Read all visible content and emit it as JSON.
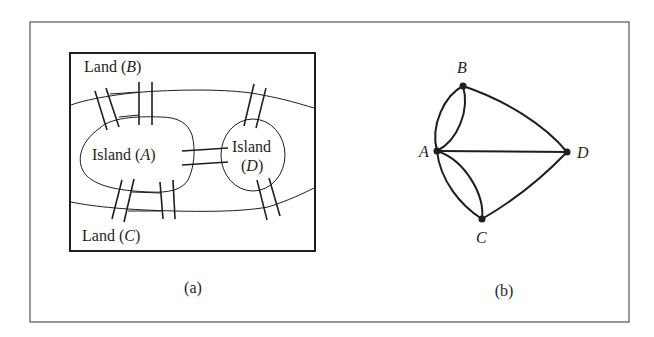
{
  "figure": {
    "panel_a": {
      "caption": "(a)",
      "labels": {
        "land_b_prefix": "Land (",
        "land_b_letter": "B",
        "land_b_suffix": ")",
        "land_c_prefix": "Land (",
        "land_c_letter": "C",
        "land_c_suffix": ")",
        "island_a_prefix": "Island (",
        "island_a_letter": "A",
        "island_a_suffix": ")",
        "island_d_line1": "Island",
        "island_d_prefix": "(",
        "island_d_letter": "D",
        "island_d_suffix": ")"
      },
      "bridge_count": 7
    },
    "panel_b": {
      "caption": "(b)",
      "nodes": [
        {
          "id": "A",
          "label": "A"
        },
        {
          "id": "B",
          "label": "B"
        },
        {
          "id": "C",
          "label": "C"
        },
        {
          "id": "D",
          "label": "D"
        }
      ],
      "edges": [
        {
          "from": "A",
          "to": "B",
          "count": 2
        },
        {
          "from": "A",
          "to": "C",
          "count": 2
        },
        {
          "from": "A",
          "to": "D",
          "count": 1
        },
        {
          "from": "B",
          "to": "D",
          "count": 1
        },
        {
          "from": "C",
          "to": "D",
          "count": 1
        }
      ]
    },
    "colors": {
      "ink": "#1e1e1e",
      "frame": "#555555",
      "background": "#ffffff"
    }
  }
}
